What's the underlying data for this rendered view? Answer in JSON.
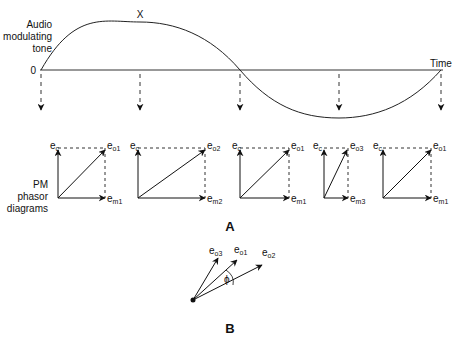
{
  "figure": {
    "waveform": {
      "label_lines": [
        "Audio",
        "modulating",
        "tone"
      ],
      "origin_label": "0",
      "time_label": "Time",
      "peak_label": "X"
    },
    "phasor_section": {
      "label_lines": [
        "PM",
        "phasor",
        "diagrams"
      ],
      "diagrams": [
        {
          "carrier": "e",
          "carrier_sub": "c",
          "output": "e",
          "output_sub": "o1",
          "mod": "e",
          "mod_sub": "m1"
        },
        {
          "carrier": "e",
          "carrier_sub": "c",
          "output": "e",
          "output_sub": "o2",
          "mod": "e",
          "mod_sub": "m2"
        },
        {
          "carrier": "e",
          "carrier_sub": "c",
          "output": "e",
          "output_sub": "o1",
          "mod": "e",
          "mod_sub": "m1"
        },
        {
          "carrier": "e",
          "carrier_sub": "c",
          "output": "e",
          "output_sub": "o3",
          "mod": "e",
          "mod_sub": "m3"
        },
        {
          "carrier": "e",
          "carrier_sub": "c",
          "output": "e",
          "output_sub": "o1",
          "mod": "e",
          "mod_sub": "m1"
        }
      ],
      "panel_label": "A"
    },
    "phase_diagram": {
      "vectors": [
        {
          "base": "e",
          "sub": "o3"
        },
        {
          "base": "e",
          "sub": "o1"
        },
        {
          "base": "e",
          "sub": "o2"
        }
      ],
      "angle_label": "ϕ",
      "panel_label": "B"
    }
  }
}
